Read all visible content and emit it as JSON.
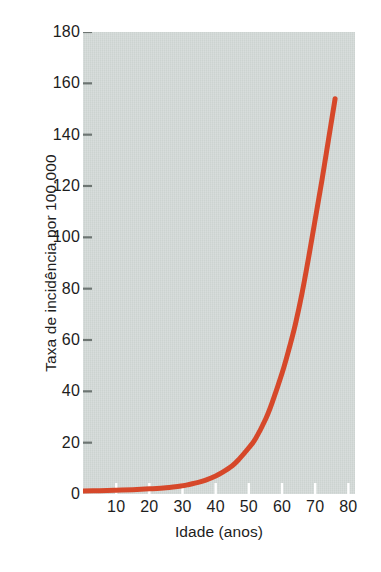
{
  "chart_data": {
    "type": "line",
    "title": "",
    "xlabel": "Idade (anos)",
    "ylabel": "Taxa de incidência por 100.000",
    "xlim": [
      0,
      82
    ],
    "ylim": [
      0,
      180
    ],
    "xticks": [
      10,
      20,
      30,
      40,
      50,
      60,
      70,
      80
    ],
    "xtick_labels": [
      "10",
      "20",
      "30",
      "40",
      "50",
      "60",
      "70",
      "80"
    ],
    "yticks": [
      0,
      20,
      40,
      60,
      80,
      100,
      120,
      140,
      160,
      180
    ],
    "ytick_labels": [
      "0",
      "20",
      "40",
      "60",
      "80",
      "100",
      "120",
      "140",
      "160",
      "180"
    ],
    "grid": false,
    "legend": null,
    "plot_bgcolor": "#ccd3d0",
    "line_color": "#d6482a",
    "line_width": 5,
    "series": [
      {
        "name": "Taxa de incidência por 100.000",
        "x": [
          0,
          5,
          10,
          15,
          20,
          25,
          30,
          32,
          35,
          37,
          40,
          42,
          45,
          47,
          50,
          52,
          55,
          57,
          60,
          62,
          64,
          66,
          68,
          70,
          72,
          74,
          76
        ],
        "y": [
          1.2,
          1.3,
          1.5,
          1.7,
          2.0,
          2.4,
          3.2,
          3.7,
          4.6,
          5.4,
          7.0,
          8.4,
          11.0,
          13.5,
          18.0,
          21.5,
          29.0,
          35.5,
          47.0,
          56.0,
          66.0,
          78.0,
          92.0,
          107.0,
          122.0,
          138.0,
          154.0
        ]
      }
    ]
  }
}
